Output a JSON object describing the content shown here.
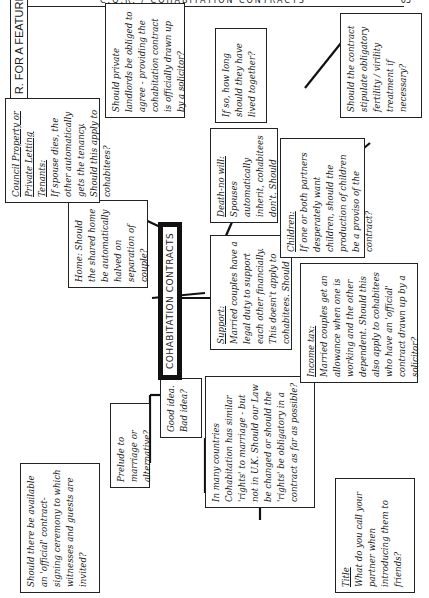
{
  "page": {
    "header_text": "C.Q.R. / COHABITATION CONTRACTS",
    "page_number": "65"
  },
  "diagram": {
    "label": "C. Q. R. FOR A FEATURE",
    "center": "COHABITATION CONTRACTS",
    "nodes": {
      "ceremony": "Should there be available an 'official' contract-signing ceremony to which witnesses and guests are invited?",
      "prelude": "Prelude to marriage or alternative?",
      "good_bad": "Good idea. Bad idea?",
      "countries": "In many countries Cohabitation has similar 'rights' to marriage - but not in U.K. Should our Law be changed or should the 'rights' be obligatory in a contract as far as possible?",
      "title_heading": "Title",
      "title_body": "What do you call your partner when introducing them to friends?",
      "home": "Home: Should the shared home be automatically halved on separation of couple?",
      "council_heading": "Council Property or Private Letting Tenants:",
      "council_body": "If spouse dies, the other automatically gets the tenancy. Should this apply to cohabitees?",
      "landlords": "Should private landlords be obliged to agree - providing the cohabitation contract is officially drawn up by a solicitor?",
      "support_heading": "Support:",
      "support_body": "Married couples have a legal duty to support each other financially. This doesn't apply to cohabitees. Should it?",
      "income_heading": "Income tax:",
      "income_body": "Married couples get an allowance when one is working and the other dependent. Should this also apply to cohabitees who have an 'official' contract drawn up by a solicitor?",
      "death_heading": "Death-no will:",
      "death_body": "Spouses automatically inherit, cohabitees don't. Should they?",
      "howlong": "If so, how long should they have lived together?",
      "children_heading": "Children:",
      "children_body": "If one or both partners desperately want children, should the production of children be a proviso of the contract?",
      "fertility": "Should the contract stipulate obligatory fertility / virility treatment if necessary?"
    }
  }
}
